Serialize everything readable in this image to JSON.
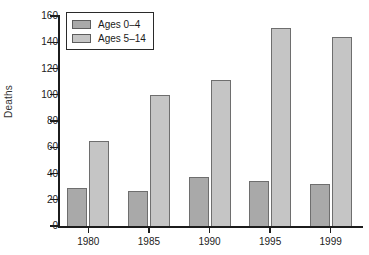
{
  "chart_data": {
    "type": "bar",
    "title": "",
    "subtitle": "",
    "xlabel": "",
    "ylabel": "Deaths",
    "categories": [
      "1980",
      "1985",
      "1990",
      "1995",
      "1999"
    ],
    "series": [
      {
        "name": "Ages 0–4",
        "color": "#a9a9a9",
        "values": [
          29,
          27,
          37,
          34,
          32
        ]
      },
      {
        "name": "Ages 5–14",
        "color": "#c5c5c5",
        "values": [
          65,
          100,
          111,
          151,
          144
        ]
      }
    ],
    "ylim": [
      0,
      160
    ],
    "yticks": [
      0,
      20,
      40,
      60,
      80,
      100,
      120,
      140,
      160
    ],
    "ytick_labels": [
      "0",
      "20",
      "40",
      "60",
      "80",
      "100",
      "120",
      "140",
      "160"
    ],
    "grid": false,
    "legend_position": "upper-left-inside",
    "legend_entries": [
      "Ages 0–4",
      "Ages 5–14"
    ],
    "annotations": []
  },
  "axes": {
    "y_title": "Deaths"
  },
  "colors": {
    "series_0": "#a9a9a9",
    "series_1": "#c5c5c5",
    "axis": "#1c1c1c",
    "bar_outline": "#6e6e6e",
    "background": "#ffffff"
  }
}
